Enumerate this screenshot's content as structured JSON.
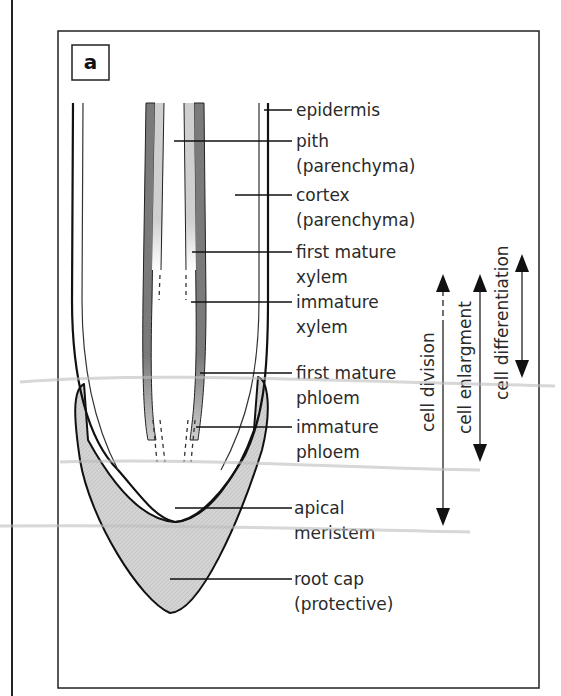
{
  "figure": {
    "panel_label": "a",
    "colors": {
      "outline": "#111111",
      "dark_tissue": "#7a7a7a",
      "light_tissue": "#cfcfcf",
      "root_cap_fill": "#d3d3d3",
      "label_text": "#2a2a2a"
    }
  },
  "labels": [
    {
      "id": "epidermis",
      "lines": [
        "epidermis"
      ]
    },
    {
      "id": "pith",
      "lines": [
        "pith",
        "(parenchyma)"
      ]
    },
    {
      "id": "cortex",
      "lines": [
        "cortex",
        "(parenchyma)"
      ]
    },
    {
      "id": "first-mature-xylem",
      "lines": [
        "first mature",
        "xylem"
      ]
    },
    {
      "id": "immature-xylem",
      "lines": [
        "immature",
        "xylem"
      ]
    },
    {
      "id": "first-mature-phloem",
      "lines": [
        "first mature",
        "phloem"
      ]
    },
    {
      "id": "immature-phloem",
      "lines": [
        "immature",
        "phloem"
      ]
    },
    {
      "id": "apical-meristem",
      "lines": [
        "apical",
        "meristem"
      ]
    },
    {
      "id": "root-cap",
      "lines": [
        "root cap",
        "(protective)"
      ]
    }
  ],
  "zones": [
    {
      "id": "cell-division",
      "label": "cell division"
    },
    {
      "id": "cell-enlargment",
      "label": "cell enlargment"
    },
    {
      "id": "cell-differentiation",
      "label": "cell differentiation"
    }
  ]
}
